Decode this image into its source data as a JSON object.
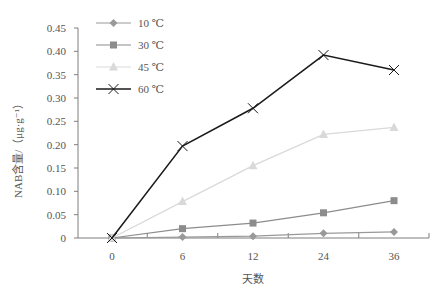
{
  "chart_data": {
    "type": "line",
    "title": "",
    "xlabel": "天数",
    "ylabel": "NAB含量/（μg·g⁻¹）",
    "categories": [
      "0",
      "6",
      "12",
      "24",
      "36"
    ],
    "ylim": [
      0,
      0.45
    ],
    "yticks": [
      "0",
      "0.05",
      "0.10",
      "0.15",
      "0.20",
      "0.25",
      "0.30",
      "0.35",
      "0.40",
      "0.45"
    ],
    "grid": false,
    "legend_position": "top-left",
    "series": [
      {
        "name": "10 ℃",
        "marker": "diamond",
        "color": "#999999",
        "values": [
          0,
          0.002,
          0.004,
          0.01,
          0.013
        ]
      },
      {
        "name": "30 ℃",
        "marker": "square",
        "color": "#8c8c8c",
        "values": [
          0,
          0.02,
          0.032,
          0.054,
          0.08
        ]
      },
      {
        "name": "45 ℃",
        "marker": "triangle",
        "color": "#d9d9d9",
        "values": [
          0,
          0.078,
          0.155,
          0.222,
          0.237
        ]
      },
      {
        "name": "60 ℃",
        "marker": "x",
        "color": "#1a1a1a",
        "values": [
          0,
          0.197,
          0.278,
          0.392,
          0.36
        ]
      }
    ]
  }
}
